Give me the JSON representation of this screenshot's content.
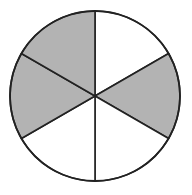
{
  "diagram": {
    "type": "fraction-circle",
    "shape": "circle",
    "total_parts": 6,
    "shaded_parts": 3,
    "fraction_shaded": "3/6",
    "sectors": [
      {
        "position": "top-right",
        "shaded": false
      },
      {
        "position": "right",
        "shaded": true
      },
      {
        "position": "bottom-right",
        "shaded": false
      },
      {
        "position": "bottom-left",
        "shaded": false
      },
      {
        "position": "left",
        "shaded": true
      },
      {
        "position": "top-left",
        "shaded": true
      }
    ],
    "colors": {
      "shaded_fill": "#b3b3b3",
      "unshaded_fill": "#ffffff",
      "stroke": "#222222"
    }
  }
}
